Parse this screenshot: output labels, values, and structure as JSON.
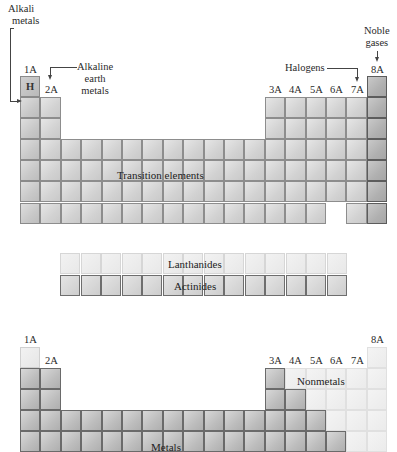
{
  "top_table": {
    "group_labels": {
      "g1": "1A",
      "g2": "2A",
      "g13": "3A",
      "g14": "4A",
      "g15": "5A",
      "g16": "6A",
      "g17": "7A",
      "g18": "8A"
    },
    "hydrogen_symbol": "H",
    "callouts": {
      "alkali_metals_line1": "Alkali",
      "alkali_metals_line2": "metals",
      "alkaline_earth_line1": "Alkaline",
      "alkaline_earth_line2": "earth",
      "alkaline_earth_line3": "metals",
      "halogens": "Halogens",
      "noble_gases_line1": "Noble",
      "noble_gases_line2": "gases"
    },
    "region_labels": {
      "transition_elements": "Transition elements"
    }
  },
  "f_block": {
    "lanthanides": "Lanthanides",
    "actinides": "Actinides",
    "cells_per_row": 14
  },
  "bottom_table": {
    "group_labels": {
      "g1": "1A",
      "g2": "2A",
      "g13": "3A",
      "g14": "4A",
      "g15": "5A",
      "g16": "6A",
      "g17": "7A",
      "g18": "8A"
    },
    "region_labels": {
      "metals": "Metals",
      "nonmetals": "Nonmetals"
    }
  },
  "colors": {
    "standard_cell": "#d6d6d6",
    "noble_gas_cell": "#b4b4b4",
    "lanthanide_cell": "#ececec",
    "actinide_cell": "#d4d4d4",
    "metal_cell": "#c2c2c2",
    "nonmetal_cell": "#eeeeee"
  }
}
